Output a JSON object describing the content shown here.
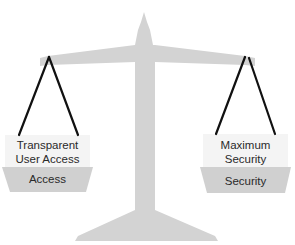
{
  "diagram": {
    "type": "balance-scale",
    "colors": {
      "scale_body": "#d3d3d3",
      "pan_top": "#f4f4f4",
      "pan_bottom": "#d0d0d0",
      "strings": "#111111",
      "text": "#2a2a2a"
    },
    "left_pan": {
      "top_label_line1": "Transparent",
      "top_label_line2": "User Access",
      "bottom_label": "Access"
    },
    "right_pan": {
      "top_label_line1": "Maximum",
      "top_label_line2": "Security",
      "bottom_label": "Security"
    }
  }
}
